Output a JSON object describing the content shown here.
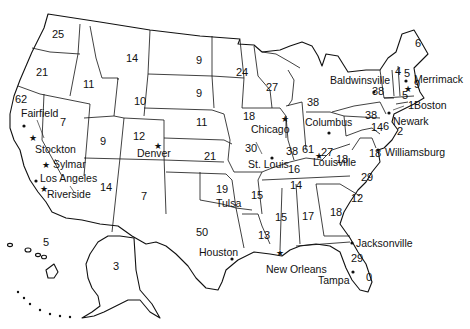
{
  "map": {
    "type": "US state map with per-state counts and city markers",
    "state_labels": [
      {
        "id": "WA",
        "value": "25",
        "x": 52,
        "y": 38
      },
      {
        "id": "OR",
        "value": "21",
        "x": 36,
        "y": 76
      },
      {
        "id": "ID",
        "value": "11",
        "x": 83,
        "y": 88
      },
      {
        "id": "MT",
        "value": "14",
        "x": 126,
        "y": 62
      },
      {
        "id": "ND",
        "value": "9",
        "x": 196,
        "y": 64
      },
      {
        "id": "MN",
        "value": "24",
        "x": 236,
        "y": 76
      },
      {
        "id": "WI",
        "value": "27",
        "x": 266,
        "y": 91
      },
      {
        "id": "MI",
        "value": "38",
        "x": 307,
        "y": 106
      },
      {
        "id": "SD",
        "value": "9",
        "x": 196,
        "y": 97
      },
      {
        "id": "WY",
        "value": "10",
        "x": 134,
        "y": 105
      },
      {
        "id": "NV",
        "value": "7",
        "x": 60,
        "y": 126
      },
      {
        "id": "CA",
        "value": "62",
        "x": 15,
        "y": 103
      },
      {
        "id": "UT",
        "value": "9",
        "x": 100,
        "y": 145
      },
      {
        "id": "CO",
        "value": "12",
        "x": 133,
        "y": 140
      },
      {
        "id": "NE",
        "value": "11",
        "x": 196,
        "y": 126
      },
      {
        "id": "IA",
        "value": "18",
        "x": 243,
        "y": 120
      },
      {
        "id": "IL",
        "value": "38",
        "x": 286,
        "y": 155
      },
      {
        "id": "IN",
        "value": "61",
        "x": 302,
        "y": 153
      },
      {
        "id": "OH",
        "value": "27",
        "x": 321,
        "y": 156
      },
      {
        "id": "KS",
        "value": "21",
        "x": 204,
        "y": 160
      },
      {
        "id": "MO",
        "value": "30",
        "x": 245,
        "y": 152
      },
      {
        "id": "AZ",
        "value": "14",
        "x": 100,
        "y": 191
      },
      {
        "id": "NM",
        "value": "7",
        "x": 141,
        "y": 200
      },
      {
        "id": "OK",
        "value": "19",
        "x": 216,
        "y": 193
      },
      {
        "id": "AR",
        "value": "15",
        "x": 251,
        "y": 199
      },
      {
        "id": "KY",
        "value": "16",
        "x": 288,
        "y": 173
      },
      {
        "id": "TN",
        "value": "14",
        "x": 290,
        "y": 189
      },
      {
        "id": "WV",
        "value": "18",
        "x": 336,
        "y": 163
      },
      {
        "id": "VA",
        "value": "18",
        "x": 369,
        "y": 157
      },
      {
        "id": "NC",
        "value": "29",
        "x": 361,
        "y": 181
      },
      {
        "id": "SC",
        "value": "12",
        "x": 351,
        "y": 202
      },
      {
        "id": "GA",
        "value": "18",
        "x": 330,
        "y": 216
      },
      {
        "id": "AL",
        "value": "17",
        "x": 302,
        "y": 220
      },
      {
        "id": "MS",
        "value": "15",
        "x": 275,
        "y": 221
      },
      {
        "id": "LA",
        "value": "13",
        "x": 258,
        "y": 239
      },
      {
        "id": "TX",
        "value": "50",
        "x": 196,
        "y": 236
      },
      {
        "id": "FL",
        "value": "29",
        "x": 351,
        "y": 262
      },
      {
        "id": "FL-south",
        "value": "0",
        "x": 366,
        "y": 281
      },
      {
        "id": "PA",
        "value": "38",
        "x": 365,
        "y": 119
      },
      {
        "id": "NY",
        "value": "38",
        "x": 372,
        "y": 95
      },
      {
        "id": "ME",
        "value": "6",
        "x": 415,
        "y": 47
      },
      {
        "id": "VT",
        "value": "4",
        "x": 395,
        "y": 75
      },
      {
        "id": "NH",
        "value": "5",
        "x": 404,
        "y": 77
      },
      {
        "id": "MA",
        "value": "9",
        "x": 414,
        "y": 88
      },
      {
        "id": "CT",
        "value": "5",
        "x": 402,
        "y": 99
      },
      {
        "id": "RI",
        "value": "1",
        "x": 408,
        "y": 109
      },
      {
        "id": "NJ",
        "value": "2",
        "x": 397,
        "y": 135
      },
      {
        "id": "MD",
        "value": "14",
        "x": 371,
        "y": 131
      },
      {
        "id": "DE",
        "value": "6",
        "x": 383,
        "y": 130
      },
      {
        "id": "AK",
        "value": "3",
        "x": 113,
        "y": 270
      },
      {
        "id": "HI",
        "value": "5",
        "x": 43,
        "y": 246
      }
    ],
    "cities": [
      {
        "name": "Fairfield",
        "marker": "dot",
        "mx": 24,
        "my": 126,
        "lx": 21,
        "ly": 117
      },
      {
        "name": "Stockton",
        "marker": "star",
        "mx": 33,
        "my": 138,
        "lx": 35,
        "ly": 153
      },
      {
        "name": "Sylmar",
        "marker": "star",
        "mx": 46,
        "my": 165,
        "lx": 53,
        "ly": 168
      },
      {
        "name": "Los Angeles",
        "marker": "dot",
        "mx": 36,
        "my": 181,
        "lx": 40,
        "ly": 182
      },
      {
        "name": "Riverside",
        "marker": "star",
        "mx": 44,
        "my": 189,
        "lx": 47,
        "ly": 198
      },
      {
        "name": "Denver",
        "marker": "star",
        "mx": 158,
        "my": 146,
        "lx": 137,
        "ly": 157
      },
      {
        "name": "Tulsa",
        "marker": "none",
        "mx": 0,
        "my": 0,
        "lx": 216,
        "ly": 207
      },
      {
        "name": "Houston",
        "marker": "dot",
        "mx": 232,
        "my": 259,
        "lx": 199,
        "ly": 256
      },
      {
        "name": "New Orleans",
        "marker": "star",
        "mx": 280,
        "my": 253,
        "lx": 266,
        "ly": 273
      },
      {
        "name": "Chicago",
        "marker": "star",
        "mx": 285,
        "my": 119,
        "lx": 251,
        "ly": 133
      },
      {
        "name": "St. Louis",
        "marker": "dot",
        "mx": 272,
        "my": 158,
        "lx": 248,
        "ly": 168
      },
      {
        "name": "Columbus",
        "marker": "dot",
        "mx": 329,
        "my": 133,
        "lx": 305,
        "ly": 126
      },
      {
        "name": "Louisville",
        "marker": "star",
        "mx": 319,
        "my": 156,
        "lx": 313,
        "ly": 166
      },
      {
        "name": "Baldwinsville",
        "marker": "dot",
        "mx": 374,
        "my": 92,
        "lx": 330,
        "ly": 84
      },
      {
        "name": "Merrimack",
        "marker": "dot",
        "mx": 406,
        "my": 81,
        "lx": 414,
        "ly": 83
      },
      {
        "name": "Boston",
        "marker": "none",
        "mx": 0,
        "my": 0,
        "lx": 414,
        "ly": 109
      },
      {
        "name": "Newark",
        "marker": "dot",
        "mx": 389,
        "my": 113,
        "lx": 393,
        "ly": 125
      },
      {
        "name": "Williamsburg",
        "marker": "dot",
        "mx": 378,
        "my": 150,
        "lx": 385,
        "ly": 156
      },
      {
        "name": "Jacksonville",
        "marker": "dot",
        "mx": 352,
        "my": 243,
        "lx": 356,
        "ly": 247
      },
      {
        "name": "Tampa",
        "marker": "dot",
        "mx": 353,
        "my": 272,
        "lx": 318,
        "ly": 284
      }
    ]
  }
}
